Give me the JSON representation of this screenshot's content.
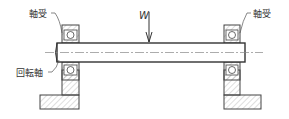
{
  "diagram": {
    "type": "mechanical-cross-section",
    "labels": {
      "bearing_left": "軸受",
      "bearing_right": "軸受",
      "shaft": "回転軸",
      "load": "W"
    },
    "colors": {
      "line": "#444444",
      "hatch": "#9a9a9a",
      "background": "#ffffff"
    }
  }
}
